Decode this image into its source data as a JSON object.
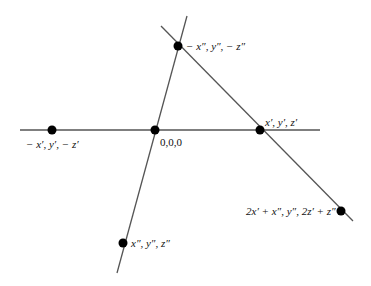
{
  "diagram": {
    "type": "geometric-lines",
    "line_color": "#555555",
    "point_color": "#000000",
    "lines": [
      {
        "name": "horizontal-line",
        "x1": 20,
        "y1": 130,
        "x2": 320,
        "y2": 130
      },
      {
        "name": "steep-line",
        "x1": 187,
        "y1": 16,
        "x2": 117,
        "y2": 273
      },
      {
        "name": "diagonal-line",
        "x1": 161,
        "y1": 26,
        "x2": 353,
        "y2": 221
      }
    ],
    "points": [
      {
        "name": "point-neg-xpp",
        "cx": 178,
        "cy": 46,
        "label": "− x″, y″, − z″"
      },
      {
        "name": "point-neg-xp",
        "cx": 52,
        "cy": 130,
        "label": "− x′, y′, − z′"
      },
      {
        "name": "point-origin",
        "cx": 155,
        "cy": 130,
        "label": "0,0,0"
      },
      {
        "name": "point-xp",
        "cx": 260,
        "cy": 130,
        "label": "x′, y′, z′"
      },
      {
        "name": "point-sum",
        "cx": 341,
        "cy": 211,
        "label": "2x′ + x″, y″, 2z′ + z″"
      },
      {
        "name": "point-xpp",
        "cx": 123,
        "cy": 243,
        "label": "x″, y″, z″"
      }
    ]
  }
}
